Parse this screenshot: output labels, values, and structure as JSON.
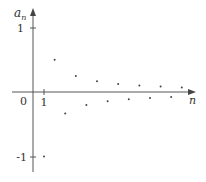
{
  "chart_data": {
    "type": "scatter",
    "title": "",
    "xlabel": "n",
    "ylabel": "a_n",
    "ylabel_main": "a",
    "ylabel_sub": "n",
    "x_tick_labels": {
      "origin": "0",
      "one": "1"
    },
    "y_tick_labels": {
      "pos_one": "1",
      "neg_one": "-1"
    },
    "xlim": [
      0,
      16
    ],
    "ylim": [
      -1.1,
      1.2
    ],
    "grid": false,
    "x": [
      1,
      2,
      3,
      4,
      5,
      6,
      7,
      8,
      9,
      10,
      11,
      12,
      13,
      14
    ],
    "y": [
      -1,
      0.5,
      -0.333,
      0.25,
      -0.2,
      0.167,
      -0.143,
      0.125,
      -0.111,
      0.1,
      -0.091,
      0.083,
      -0.077,
      0.071
    ],
    "point_color": "#444444",
    "axis_color": "#555555"
  }
}
